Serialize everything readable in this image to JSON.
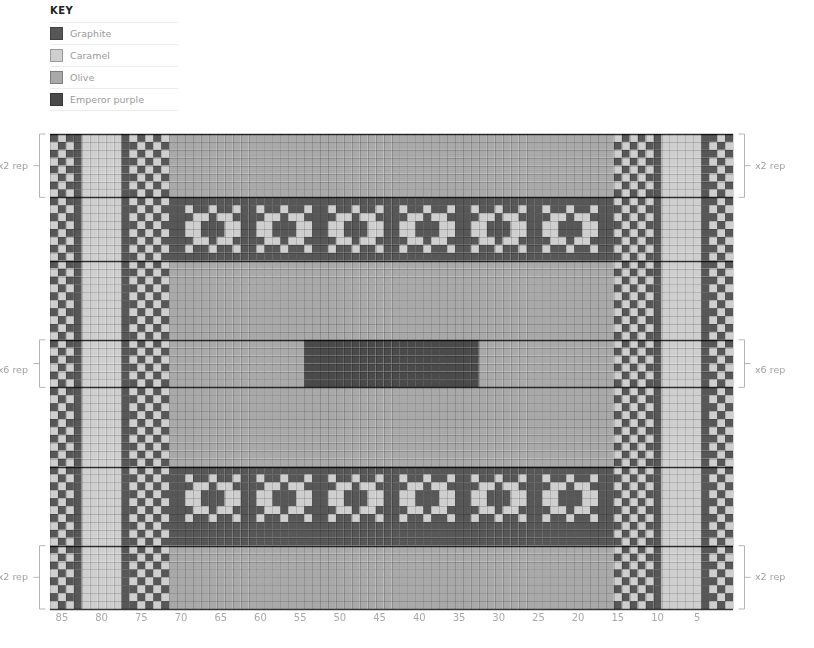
{
  "key": {
    "title": "KEY",
    "items": [
      {
        "label": "Graphite",
        "color": "#575757"
      },
      {
        "label": "Caramel",
        "color": "#cfcfcf"
      },
      {
        "label": "Olive",
        "color": "#a9a9a9"
      },
      {
        "label": "Emperor purple",
        "color": "#4a4a4a"
      }
    ]
  },
  "chart_data": {
    "type": "heatmap",
    "columns": 86,
    "x_tick_labels": [
      "85",
      "80",
      "75",
      "70",
      "65",
      "60",
      "55",
      "50",
      "45",
      "40",
      "35",
      "30",
      "25",
      "20",
      "15",
      "10",
      "5"
    ],
    "legend": [
      "Graphite",
      "Caramel",
      "Olive",
      "Emperor purple"
    ],
    "sections": [
      {
        "name": "top-border-band",
        "rows": 8,
        "center": "Olive"
      },
      {
        "name": "motif-band-1",
        "rows": 8,
        "center": "Graphite with Caramel motifs"
      },
      {
        "name": "plain-band-1",
        "rows": 10,
        "center": "Olive"
      },
      {
        "name": "center-block",
        "rows": 6,
        "center": "Olive with Emperor purple block cols 35-57"
      },
      {
        "name": "plain-band-2",
        "rows": 10,
        "center": "Olive"
      },
      {
        "name": "motif-band-2",
        "rows": 8,
        "center": "Graphite with Caramel motifs"
      },
      {
        "name": "bottom-border-band",
        "rows": 8,
        "center": "Olive"
      }
    ],
    "repeat_annotations": {
      "left": [
        {
          "label": "x2 rep",
          "section": "top-border-band"
        },
        {
          "label": "x6 rep",
          "section": "center-block"
        },
        {
          "label": "x2 rep",
          "section": "bottom-border-band"
        }
      ],
      "right": [
        {
          "label": "x2 rep",
          "section": "top-border-band"
        },
        {
          "label": "x6 rep",
          "section": "center-block"
        },
        {
          "label": "x2 rep",
          "section": "bottom-border-band"
        }
      ]
    }
  },
  "rep": {
    "left_top": "x2 rep",
    "left_mid": "x6 rep",
    "left_bot": "x2 rep",
    "right_top": "x2 rep",
    "right_mid": "x6 rep",
    "right_bot": "x2 rep"
  }
}
